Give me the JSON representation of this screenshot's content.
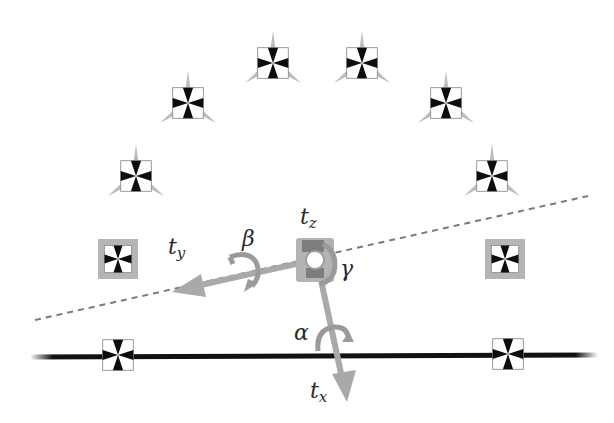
{
  "colors": {
    "background": "#ffffff",
    "arrow": "#a9a9a9",
    "ground_line": "#111111",
    "dashed_line": "#7a7a7a",
    "marker_black": "#0d0d0d",
    "marker_frame_highlight": "#b5b5b5",
    "camera_spike": "#bdbdbd",
    "label": "#2a2a2a"
  },
  "labels": {
    "tz": {
      "base": "t",
      "sub": "z"
    },
    "ty": {
      "base": "t",
      "sub": "y"
    },
    "tx": {
      "base": "t",
      "sub": "x"
    },
    "beta": "β",
    "gamma": "γ",
    "alpha": "α"
  },
  "markers": [
    {
      "id": "arc-top-left-inner",
      "cx": 273,
      "cy": 63,
      "camera": true,
      "highlight": false
    },
    {
      "id": "arc-top-right-inner",
      "cx": 362,
      "cy": 63,
      "camera": true,
      "highlight": false
    },
    {
      "id": "arc-upper-left",
      "cx": 188,
      "cy": 103,
      "camera": true,
      "highlight": false
    },
    {
      "id": "arc-upper-right",
      "cx": 446,
      "cy": 103,
      "camera": true,
      "highlight": false
    },
    {
      "id": "arc-mid-left",
      "cx": 136,
      "cy": 176,
      "camera": true,
      "highlight": false
    },
    {
      "id": "arc-mid-right",
      "cx": 492,
      "cy": 176,
      "camera": true,
      "highlight": false
    },
    {
      "id": "side-left",
      "cx": 118,
      "cy": 259,
      "camera": false,
      "highlight": true
    },
    {
      "id": "side-right",
      "cx": 505,
      "cy": 259,
      "camera": false,
      "highlight": true
    },
    {
      "id": "ground-left",
      "cx": 118,
      "cy": 355,
      "camera": false,
      "highlight": false
    },
    {
      "id": "ground-right",
      "cx": 508,
      "cy": 354,
      "camera": false,
      "highlight": false
    }
  ],
  "geometry": {
    "center": {
      "x": 315,
      "y": 259
    },
    "ground_line": {
      "x1": 30,
      "y1": 357,
      "x2": 598,
      "y2": 355
    },
    "dashed_line": {
      "x1": 35,
      "y1": 320,
      "x2": 588,
      "y2": 196
    },
    "ty_arrow_tip": {
      "x": 172,
      "y": 292
    },
    "tx_arrow_tip": {
      "x": 347,
      "y": 402
    }
  }
}
